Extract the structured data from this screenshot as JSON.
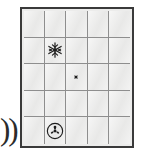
{
  "board": {
    "kind": "puzzle-grid",
    "rows": 5,
    "columns": 5,
    "border_color": "#3a3a3a",
    "gridline_color": "#8e8e8e",
    "cell_fill": "#ededec",
    "cells": [
      [
        {
          "row": 1,
          "col": 1,
          "symbol": null
        },
        {
          "row": 1,
          "col": 2,
          "symbol": null
        },
        {
          "row": 1,
          "col": 3,
          "symbol": null
        },
        {
          "row": 1,
          "col": 4,
          "symbol": null
        },
        {
          "row": 1,
          "col": 5,
          "symbol": null
        }
      ],
      [
        {
          "row": 2,
          "col": 1,
          "symbol": null
        },
        {
          "row": 2,
          "col": 2,
          "symbol": "snowflake-icon"
        },
        {
          "row": 2,
          "col": 3,
          "symbol": null
        },
        {
          "row": 2,
          "col": 4,
          "symbol": null
        },
        {
          "row": 2,
          "col": 5,
          "symbol": null
        }
      ],
      [
        {
          "row": 3,
          "col": 1,
          "symbol": null
        },
        {
          "row": 3,
          "col": 2,
          "symbol": null
        },
        {
          "row": 3,
          "col": 3,
          "symbol": "iron-cross-icon"
        },
        {
          "row": 3,
          "col": 4,
          "symbol": null
        },
        {
          "row": 3,
          "col": 5,
          "symbol": null
        }
      ],
      [
        {
          "row": 4,
          "col": 1,
          "symbol": null
        },
        {
          "row": 4,
          "col": 2,
          "symbol": null
        },
        {
          "row": 4,
          "col": 3,
          "symbol": null
        },
        {
          "row": 4,
          "col": 4,
          "symbol": null
        },
        {
          "row": 4,
          "col": 5,
          "symbol": null
        }
      ],
      [
        {
          "row": 5,
          "col": 1,
          "symbol": null
        },
        {
          "row": 5,
          "col": 2,
          "symbol": "propeller-circle-icon"
        },
        {
          "row": 5,
          "col": 3,
          "symbol": null
        },
        {
          "row": 5,
          "col": 4,
          "symbol": null
        },
        {
          "row": 5,
          "col": 5,
          "symbol": null
        }
      ]
    ],
    "symbols": [
      {
        "name": "snowflake-icon",
        "row": 2,
        "col": 2
      },
      {
        "name": "iron-cross-icon",
        "row": 3,
        "col": 3
      },
      {
        "name": "propeller-circle-icon",
        "row": 5,
        "col": 2
      }
    ]
  },
  "margin_artifact": {
    "text": "))",
    "color": "#2b2b2b"
  }
}
